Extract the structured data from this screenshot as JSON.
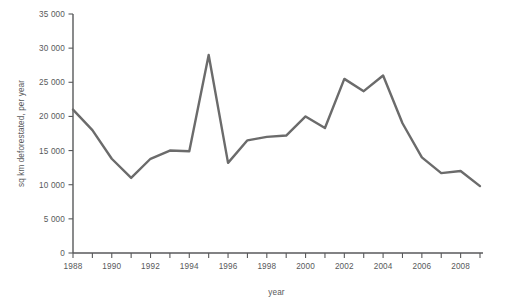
{
  "chart_data": {
    "type": "line",
    "title": "",
    "xlabel": "year",
    "ylabel": "sq km deforestated, per year",
    "x": [
      1988,
      1989,
      1990,
      1991,
      1992,
      1993,
      1994,
      1995,
      1996,
      1997,
      1998,
      1999,
      2000,
      2001,
      2002,
      2003,
      2004,
      2005,
      2006,
      2007,
      2008,
      2009
    ],
    "values": [
      21000,
      18000,
      13800,
      11000,
      13800,
      15000,
      14900,
      29000,
      13200,
      16500,
      17000,
      17200,
      20000,
      18300,
      25500,
      23700,
      26000,
      19000,
      14000,
      11700,
      12000,
      9800
    ],
    "series": [
      {
        "name": "sq km deforestated, per year",
        "values": [
          21000,
          18000,
          13800,
          11000,
          13800,
          15000,
          14900,
          29000,
          13200,
          16500,
          17000,
          17200,
          20000,
          18300,
          25500,
          23700,
          26000,
          19000,
          14000,
          11700,
          12000,
          9800
        ]
      }
    ],
    "xlim": [
      1988,
      2009
    ],
    "ylim": [
      0,
      35000
    ],
    "yticks": [
      0,
      5000,
      10000,
      15000,
      20000,
      25000,
      30000,
      35000
    ],
    "ytick_labels": [
      "0",
      "5 000",
      "10 000",
      "15 000",
      "20 000",
      "25 000",
      "30 000",
      "35 000"
    ],
    "xticks": [
      1988,
      1989,
      1990,
      1991,
      1992,
      1993,
      1994,
      1995,
      1996,
      1997,
      1998,
      1999,
      2000,
      2001,
      2002,
      2003,
      2004,
      2005,
      2006,
      2007,
      2008,
      2009
    ],
    "xtick_labels": [
      "1988",
      "",
      "1990",
      "",
      "1992",
      "",
      "1994",
      "",
      "1996",
      "",
      "1998",
      "",
      "2000",
      "",
      "2002",
      "",
      "2004",
      "",
      "2006",
      "",
      "2008",
      ""
    ],
    "grid": false,
    "legend": null,
    "legend_position": "none",
    "line_color": "#6b6b6b",
    "axis_color": "#58595b",
    "background_color": "#ffffff"
  }
}
